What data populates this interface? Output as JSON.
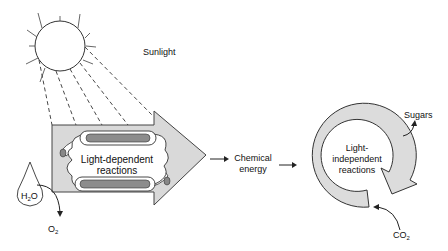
{
  "labels": {
    "sunlight": "Sunlight",
    "light_dependent_line1": "Light-dependent",
    "light_dependent_line2": "reactions",
    "water": "H",
    "water_sub": "2",
    "water_end": "O",
    "oxygen": "O",
    "oxygen_sub": "2",
    "chemical_energy_line1": "Chemical",
    "chemical_energy_line2": "energy",
    "light_independent_line1": "Light-",
    "light_independent_line2": "independent",
    "light_independent_line3": "reactions",
    "sugars": "Sugars",
    "co2": "CO",
    "co2_sub": "2"
  },
  "colors": {
    "arrow_fill": "#d9d9d9",
    "stroke": "#222222",
    "thylakoid_dark": "#8c8c8c",
    "cycle_fill": "#dcdcdc"
  }
}
